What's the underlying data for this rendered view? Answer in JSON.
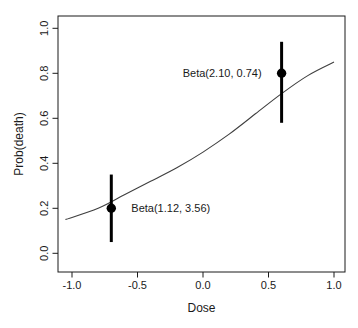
{
  "window": {
    "background": "#ffffff"
  },
  "chart_data": {
    "type": "scatter",
    "title": "",
    "xlabel": "Dose",
    "ylabel": "Prob(death)",
    "xlim": [
      -1.11,
      1.08
    ],
    "ylim": [
      -0.08,
      1.05
    ],
    "grid": false,
    "x_ticks": [
      -1.0,
      -0.5,
      0.0,
      0.5,
      1.0
    ],
    "x_tick_labels": [
      "-1.0",
      "-0.5",
      "0.0",
      "0.5",
      "1.0"
    ],
    "y_ticks": [
      0.0,
      0.2,
      0.4,
      0.6,
      0.8,
      1.0
    ],
    "y_tick_labels": [
      "0.0",
      "0.2",
      "0.4",
      "0.6",
      "0.8",
      "1.0"
    ],
    "points": [
      {
        "x": -0.7,
        "y": 0.2,
        "ci_low": 0.05,
        "ci_high": 0.35,
        "label": "Beta(1.12, 3.56)",
        "label_side": "right"
      },
      {
        "x": 0.6,
        "y": 0.8,
        "ci_low": 0.58,
        "ci_high": 0.94,
        "label": "Beta(2.10, 0.74)",
        "label_side": "left"
      }
    ],
    "curve": {
      "x": [
        -1.05,
        -0.8,
        -0.6,
        -0.4,
        -0.2,
        0.0,
        0.2,
        0.4,
        0.6,
        0.8,
        1.0
      ],
      "y": [
        0.15,
        0.2,
        0.26,
        0.32,
        0.38,
        0.45,
        0.53,
        0.62,
        0.71,
        0.79,
        0.85
      ]
    },
    "colors": {
      "point": "#000000",
      "error_bar": "#000000",
      "curve": "#3f3f3f",
      "axis": "#1a1a1a",
      "text": "#1a1a1a",
      "background": "#ffffff"
    }
  }
}
